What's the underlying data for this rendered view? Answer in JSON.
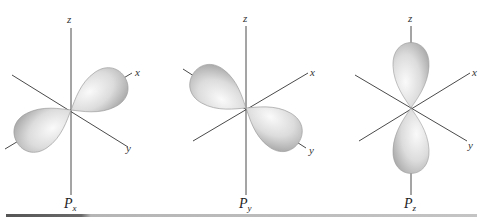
{
  "figure": {
    "colors": {
      "axis": "#4a4a4a",
      "lobe_light": "#f4f4f4",
      "lobe_dark": "#a8a8a8",
      "rule_dark": "#555555",
      "rule_light": "#bdbdbd"
    },
    "panels": [
      {
        "id": "px",
        "title_main": "P",
        "title_sub": "x",
        "axis_labels": {
          "z": "z",
          "x": "x",
          "y": "y"
        },
        "lobe_axis": "x"
      },
      {
        "id": "py",
        "title_main": "P",
        "title_sub": "y",
        "axis_labels": {
          "z": "z",
          "x": "x",
          "y": "y"
        },
        "lobe_axis": "y"
      },
      {
        "id": "pz",
        "title_main": "P",
        "title_sub": "z",
        "axis_labels": {
          "z": "z",
          "x": "x",
          "y": "y"
        },
        "lobe_axis": "z"
      }
    ]
  }
}
